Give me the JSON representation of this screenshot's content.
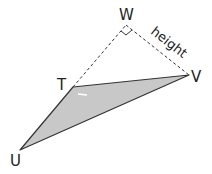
{
  "diagram": {
    "type": "geometry-triangle",
    "points": {
      "W": {
        "label": "W",
        "x": 126,
        "y": 25
      },
      "V": {
        "label": "V",
        "x": 189,
        "y": 75
      },
      "T": {
        "label": "T",
        "x": 73,
        "y": 87
      },
      "U": {
        "label": "U",
        "x": 20,
        "y": 150
      }
    },
    "shaded_triangle": [
      "T",
      "U",
      "V"
    ],
    "dashed_segments": [
      [
        "T",
        "W"
      ],
      [
        "W",
        "V"
      ]
    ],
    "right_angle_at": "W",
    "height_label": "height",
    "colors": {
      "fill": "#c8c8c8",
      "stroke": "#333333",
      "background": "#ffffff"
    }
  }
}
